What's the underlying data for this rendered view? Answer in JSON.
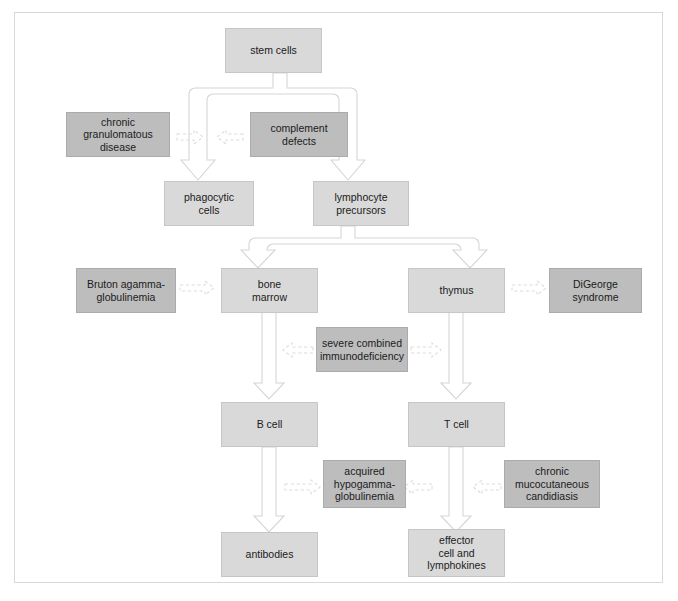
{
  "figure": {
    "colors": {
      "normal_box_fill": "#d9d9d9",
      "disease_box_fill": "#bdbdbd",
      "arrow_fill": "#ffffff",
      "arrow_stroke": "#d5d5d5",
      "dashed_arrow_stroke": "#dcdcdc",
      "frame_border": "#d8d8d8",
      "page_background": "#ffffff",
      "text": "#1b1b1b"
    }
  },
  "nodes": {
    "stem_cells": {
      "label": "stem cells",
      "kind": "normal"
    },
    "chronic_granulomatous_disease": {
      "label": "chronic\ngranulomatous\ndisease",
      "kind": "disease"
    },
    "complement_defects": {
      "label": "complement\ndefects",
      "kind": "disease"
    },
    "phagocytic_cells": {
      "label": "phagocytic\ncells",
      "kind": "normal"
    },
    "lymphocyte_precursors": {
      "label": "lymphocyte\nprecursors",
      "kind": "normal"
    },
    "bruton_agammaglobulinemia": {
      "label": "Bruton agamma-\nglobulinemia",
      "kind": "disease"
    },
    "bone_marrow": {
      "label": "bone\nmarrow",
      "kind": "normal"
    },
    "thymus": {
      "label": "thymus",
      "kind": "normal"
    },
    "digeorge_syndrome": {
      "label": "DiGeorge\nsyndrome",
      "kind": "disease"
    },
    "severe_combined_immunodeficiency": {
      "label": "severe combined\nimmunodeficiency",
      "kind": "disease"
    },
    "b_cell": {
      "label": "B cell",
      "kind": "normal"
    },
    "t_cell": {
      "label": "T cell",
      "kind": "normal"
    },
    "acquired_hypogammaglobulinemia": {
      "label": "acquired\nhypogamma-\nglobulinemia",
      "kind": "disease"
    },
    "chronic_mucocutaneous_candidiasis": {
      "label": "chronic\nmucocutaneous\ncandidiasis",
      "kind": "disease"
    },
    "antibodies": {
      "label": "antibodies",
      "kind": "normal"
    },
    "effector_cell_and_lymphokines": {
      "label": "effector\ncell and\nlymphokines",
      "kind": "normal"
    }
  },
  "flow_edges": [
    {
      "from": "stem_cells",
      "to": "phagocytic_cells",
      "style": "block-arrow"
    },
    {
      "from": "stem_cells",
      "to": "lymphocyte_precursors",
      "style": "block-arrow"
    },
    {
      "from": "lymphocyte_precursors",
      "to": "bone_marrow",
      "style": "block-arrow"
    },
    {
      "from": "lymphocyte_precursors",
      "to": "thymus",
      "style": "block-arrow"
    },
    {
      "from": "bone_marrow",
      "to": "b_cell",
      "style": "block-arrow"
    },
    {
      "from": "thymus",
      "to": "t_cell",
      "style": "block-arrow"
    },
    {
      "from": "b_cell",
      "to": "antibodies",
      "style": "block-arrow"
    },
    {
      "from": "t_cell",
      "to": "effector_cell_and_lymphokines",
      "style": "block-arrow"
    }
  ],
  "defect_edges": [
    {
      "from": "chronic_granulomatous_disease",
      "to": "stem-to-phagocyte-arrow",
      "style": "dashed-arrow",
      "direction": "right"
    },
    {
      "from": "complement_defects",
      "to": "stem-to-phagocyte-arrow",
      "style": "dashed-arrow",
      "direction": "left"
    },
    {
      "from": "bruton_agammaglobulinemia",
      "to": "bone_marrow",
      "style": "dashed-arrow",
      "direction": "right"
    },
    {
      "from": "thymus",
      "to": "digeorge_syndrome",
      "style": "dashed-arrow",
      "direction": "right"
    },
    {
      "from": "severe_combined_immunodeficiency",
      "to": "bone-to-bcell-arrow",
      "style": "dashed-arrow",
      "direction": "left"
    },
    {
      "from": "severe_combined_immunodeficiency",
      "to": "thymus-to-tcell-arrow",
      "style": "dashed-arrow",
      "direction": "right"
    },
    {
      "from": "bcell-to-antibodies-arrow",
      "to": "acquired_hypogammaglobulinemia",
      "style": "dashed-arrow",
      "direction": "right"
    },
    {
      "from": "acquired_hypogammaglobulinemia",
      "to": "tcell-to-effector-arrow",
      "style": "dashed-arrow",
      "direction": "left"
    },
    {
      "from": "chronic_mucocutaneous_candidiasis",
      "to": "tcell-to-effector-arrow",
      "style": "dashed-arrow",
      "direction": "left"
    }
  ]
}
